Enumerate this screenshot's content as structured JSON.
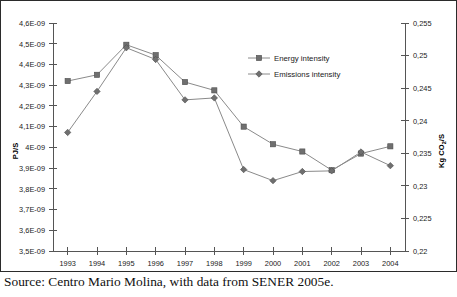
{
  "caption": "Source: Centro Mario Molina, with data from SENER 2005e.",
  "legend": {
    "energy": "Energy intensity",
    "emissions": "Emissions intensity"
  },
  "axes": {
    "left_title": "PJ/S",
    "right_title": "Kg CO",
    "right_title_sub": "2",
    "right_title_tail": "/S"
  },
  "chart_data": {
    "type": "line",
    "title": "",
    "xlabel": "",
    "ylabel": "PJ/S",
    "y2label": "Kg CO2/S",
    "grid": false,
    "legend_position": "upper-right",
    "categories": [
      "1993",
      "1994",
      "1995",
      "1996",
      "1997",
      "1998",
      "1999",
      "2000",
      "2001",
      "2002",
      "2003",
      "2004"
    ],
    "ylim": [
      3.5e-09,
      4.6e-09
    ],
    "y2lim": [
      0.22,
      0.255
    ],
    "yticks": [
      "3,5E-09",
      "3,6E-09",
      "3,7E-09",
      "3,8E-09",
      "3,9E-09",
      "4E-09",
      "4,1E-09",
      "4,2E-09",
      "4,3E-09",
      "4,4E-09",
      "4,5E-09",
      "4,6E-09"
    ],
    "y2ticks": [
      "0,22",
      "0,225",
      "0,23",
      "0,235",
      "0,24",
      "0,245",
      "0,25",
      "0,255"
    ],
    "series": [
      {
        "name": "Energy intensity",
        "axis": "left",
        "marker": "square",
        "values": [
          4.32e-09,
          4.35e-09,
          4.495e-09,
          4.445e-09,
          4.315e-09,
          4.275e-09,
          4.1e-09,
          4.015e-09,
          3.98e-09,
          3.89e-09,
          3.97e-09,
          4.005e-09
        ]
      },
      {
        "name": "Emissions intensity",
        "axis": "right",
        "marker": "diamond",
        "values": [
          0.2382,
          0.2445,
          0.2512,
          0.2494,
          0.2432,
          0.2435,
          0.2325,
          0.2308,
          0.2322,
          0.2323,
          0.2352,
          0.2331
        ]
      }
    ]
  }
}
